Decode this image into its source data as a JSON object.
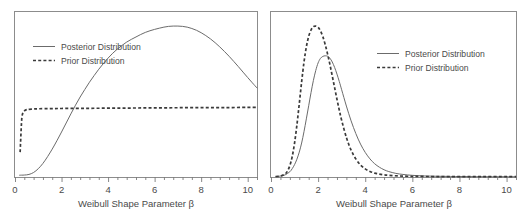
{
  "figure": {
    "background_color": "#ffffff",
    "panel_count": 2,
    "frame_color": "#8c8c8c",
    "posterior_color": "#6b6b6b",
    "prior_color": "#3a3a3a"
  },
  "chart_data": [
    {
      "type": "line",
      "panel": "left",
      "title": "",
      "xlabel": "Weibull Shape Parameter β",
      "ylabel": "",
      "xlim": [
        0,
        10.4
      ],
      "ylim": [
        0,
        1.08
      ],
      "grid": false,
      "xticks": [
        0,
        2,
        4,
        6,
        8,
        10
      ],
      "xtick_labels": [
        "0",
        "2",
        "4",
        "6",
        "8",
        "10"
      ],
      "minor_xticks": [
        0.4,
        0.8,
        1.2,
        1.6,
        2.4,
        2.8,
        3.2,
        3.6,
        4.4,
        4.8,
        5.2,
        5.6,
        6.4,
        6.8,
        7.2,
        7.6,
        8.4,
        8.8,
        9.2,
        9.6,
        10.4
      ],
      "yticks": [],
      "ytick_labels": [],
      "legend_position": "upper-left",
      "series": [
        {
          "name": "Posterior Distribution",
          "style": "solid",
          "color": "#6b6b6b",
          "x": [
            0.2,
            0.4,
            0.6,
            0.8,
            1.0,
            1.2,
            1.4,
            1.6,
            1.8,
            2.0,
            2.2,
            2.4,
            2.6,
            2.8,
            3.0,
            3.2,
            3.4,
            3.6,
            3.8,
            4.0,
            4.2,
            4.4,
            4.6,
            4.8,
            5.0,
            5.2,
            5.4,
            5.6,
            5.8,
            6.0,
            6.2,
            6.4,
            6.6,
            6.8,
            7.0,
            7.2,
            7.4,
            7.6,
            7.8,
            8.0,
            8.2,
            8.4,
            8.6,
            8.8,
            9.0,
            9.2,
            9.4,
            9.6,
            9.8,
            10.0,
            10.2,
            10.4
          ],
          "y": [
            0.012,
            0.013,
            0.017,
            0.03,
            0.055,
            0.09,
            0.135,
            0.185,
            0.24,
            0.298,
            0.358,
            0.418,
            0.476,
            0.53,
            0.58,
            0.628,
            0.672,
            0.714,
            0.752,
            0.788,
            0.82,
            0.848,
            0.872,
            0.894,
            0.912,
            0.928,
            0.944,
            0.958,
            0.969,
            0.978,
            0.986,
            0.993,
            0.998,
            1.0,
            1.0,
            0.998,
            0.993,
            0.984,
            0.972,
            0.956,
            0.937,
            0.915,
            0.89,
            0.862,
            0.832,
            0.8,
            0.766,
            0.731,
            0.695,
            0.659,
            0.624,
            0.59
          ]
        },
        {
          "name": "Prior Distribution",
          "style": "dashed",
          "color": "#3a3a3a",
          "x": [
            0.22,
            0.24,
            0.26,
            0.28,
            0.3,
            0.34,
            0.4,
            0.5,
            0.7,
            1.0,
            1.5,
            2.0,
            3.0,
            4.0,
            5.0,
            6.0,
            7.0,
            8.0,
            9.0,
            10.0,
            10.4
          ],
          "y": [
            0.165,
            0.23,
            0.3,
            0.36,
            0.4,
            0.425,
            0.438,
            0.446,
            0.45,
            0.452,
            0.453,
            0.454,
            0.455,
            0.456,
            0.457,
            0.458,
            0.459,
            0.46,
            0.46,
            0.461,
            0.461
          ]
        }
      ]
    },
    {
      "type": "line",
      "panel": "right",
      "title": "",
      "xlabel": "Weibull Shape Parameter β",
      "ylabel": "",
      "xlim": [
        0,
        10.4
      ],
      "ylim": [
        0,
        1.08
      ],
      "grid": false,
      "xticks": [
        0,
        2,
        4,
        6,
        8,
        10
      ],
      "xtick_labels": [
        "0",
        "2",
        "4",
        "6",
        "8",
        "10"
      ],
      "minor_xticks": [
        0.4,
        0.8,
        1.2,
        1.6,
        2.4,
        2.8,
        3.2,
        3.6,
        4.4,
        4.8,
        5.2,
        5.6,
        6.4,
        6.8,
        7.2,
        7.6,
        8.4,
        8.8,
        9.2,
        9.6,
        10.4
      ],
      "yticks": [],
      "ytick_labels": [],
      "legend_position": "upper-right",
      "series": [
        {
          "name": "Posterior Distribution",
          "style": "solid",
          "color": "#6b6b6b",
          "peak_x": 2.4,
          "peak_y": 0.8,
          "x": [
            0.2,
            0.4,
            0.6,
            0.8,
            0.9,
            1.0,
            1.1,
            1.2,
            1.3,
            1.4,
            1.5,
            1.6,
            1.7,
            1.8,
            1.9,
            2.0,
            2.1,
            2.2,
            2.3,
            2.4,
            2.5,
            2.6,
            2.7,
            2.8,
            2.9,
            3.0,
            3.2,
            3.4,
            3.6,
            3.8,
            4.0,
            4.2,
            4.4,
            4.6,
            4.8,
            5.0,
            5.3,
            5.6,
            6.0,
            6.5,
            7.0,
            7.5,
            8.0,
            9.0,
            10.0,
            10.4
          ],
          "y": [
            0.004,
            0.006,
            0.014,
            0.035,
            0.055,
            0.082,
            0.118,
            0.165,
            0.225,
            0.3,
            0.385,
            0.472,
            0.56,
            0.64,
            0.706,
            0.756,
            0.786,
            0.799,
            0.803,
            0.8,
            0.787,
            0.762,
            0.726,
            0.682,
            0.632,
            0.578,
            0.47,
            0.372,
            0.288,
            0.218,
            0.163,
            0.12,
            0.088,
            0.065,
            0.048,
            0.036,
            0.024,
            0.017,
            0.011,
            0.007,
            0.005,
            0.004,
            0.003,
            0.002,
            0.002,
            0.002
          ]
        },
        {
          "name": "Prior Distribution",
          "style": "dashed",
          "color": "#3a3a3a",
          "peak_x": 1.95,
          "peak_y": 1.0,
          "x": [
            0.2,
            0.4,
            0.6,
            0.7,
            0.8,
            0.9,
            1.0,
            1.1,
            1.2,
            1.3,
            1.4,
            1.5,
            1.6,
            1.7,
            1.8,
            1.9,
            2.0,
            2.1,
            2.2,
            2.3,
            2.4,
            2.5,
            2.6,
            2.7,
            2.8,
            2.9,
            3.0,
            3.2,
            3.4,
            3.6,
            3.8,
            4.0,
            4.2,
            4.4,
            4.6,
            4.8,
            5.0,
            5.4,
            5.8,
            6.2,
            7.0,
            8.0,
            9.0,
            10.0,
            10.4
          ],
          "y": [
            0.003,
            0.006,
            0.02,
            0.04,
            0.075,
            0.135,
            0.225,
            0.345,
            0.485,
            0.63,
            0.76,
            0.862,
            0.932,
            0.974,
            0.996,
            1.0,
            0.992,
            0.968,
            0.93,
            0.878,
            0.816,
            0.746,
            0.67,
            0.592,
            0.515,
            0.442,
            0.375,
            0.262,
            0.178,
            0.12,
            0.08,
            0.054,
            0.037,
            0.026,
            0.019,
            0.014,
            0.011,
            0.007,
            0.005,
            0.004,
            0.003,
            0.002,
            0.002,
            0.002,
            0.002
          ]
        }
      ]
    }
  ],
  "panels": [
    {
      "id": "left",
      "legend": {
        "entries": [
          {
            "label": "Posterior Distribution",
            "style": "solid"
          },
          {
            "label": "Prior Distribution",
            "style": "dashed"
          }
        ]
      },
      "axis_title": "Weibull Shape Parameter β",
      "tick_labels": [
        "0",
        "2",
        "4",
        "6",
        "8",
        "10"
      ]
    },
    {
      "id": "right",
      "legend": {
        "entries": [
          {
            "label": "Posterior Distribution",
            "style": "solid"
          },
          {
            "label": "Prior Distribution",
            "style": "dashed"
          }
        ]
      },
      "axis_title": "Weibull Shape Parameter β",
      "tick_labels": [
        "0",
        "2",
        "4",
        "6",
        "8",
        "10"
      ]
    }
  ]
}
